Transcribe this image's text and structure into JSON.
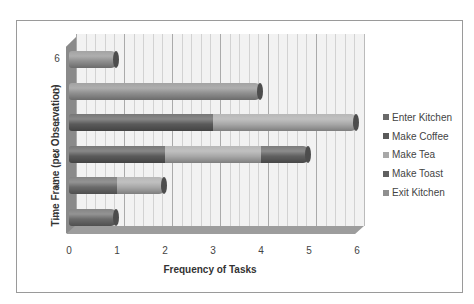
{
  "chart_data": {
    "type": "bar",
    "orientation": "horizontal",
    "stacked": true,
    "style": "3d-cylinder",
    "title": "",
    "xlabel": "Frequency of Tasks",
    "ylabel": "Time Frame (per Observation)",
    "xlim": [
      0,
      6
    ],
    "x_ticks": [
      "0",
      "1",
      "2",
      "3",
      "4",
      "5",
      "6"
    ],
    "categories": [
      "1",
      "2",
      "3",
      "4",
      "5",
      "6"
    ],
    "series": [
      {
        "name": "Enter Kitchen",
        "values": [
          1,
          1,
          0,
          0,
          0,
          0
        ],
        "color": "#6a6a6a"
      },
      {
        "name": "Make Coffee",
        "values": [
          0,
          0,
          2,
          3,
          0,
          0
        ],
        "color": "#5a5a5a"
      },
      {
        "name": "Make Tea",
        "values": [
          0,
          1,
          2,
          3,
          0,
          0
        ],
        "color": "#a8a8a8"
      },
      {
        "name": "Make Toast",
        "values": [
          0,
          0,
          1,
          0,
          0,
          0
        ],
        "color": "#606060"
      },
      {
        "name": "Exit Kitchen",
        "values": [
          0,
          0,
          0,
          0,
          4,
          1
        ],
        "color": "#8f8f8f"
      }
    ],
    "grid": true,
    "legend_position": "right"
  },
  "legend": {
    "items": [
      {
        "label": "Enter Kitchen",
        "color": "#6a6a6a"
      },
      {
        "label": "Make Coffee",
        "color": "#5a5a5a"
      },
      {
        "label": "Make Tea",
        "color": "#a8a8a8"
      },
      {
        "label": "Make Toast",
        "color": "#606060"
      },
      {
        "label": "Exit Kitchen",
        "color": "#8f8f8f"
      }
    ]
  }
}
